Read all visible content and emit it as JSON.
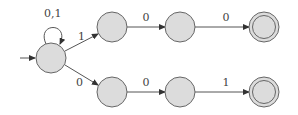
{
  "diagram": {
    "type": "nfa",
    "states": [
      {
        "id": "q0",
        "x": 51,
        "y": 58,
        "start": true,
        "accept": false
      },
      {
        "id": "q1",
        "x": 112,
        "y": 27,
        "accept": false
      },
      {
        "id": "q2",
        "x": 180,
        "y": 27,
        "accept": false
      },
      {
        "id": "q3",
        "x": 264,
        "y": 27,
        "accept": true
      },
      {
        "id": "q4",
        "x": 112,
        "y": 92,
        "accept": false
      },
      {
        "id": "q5",
        "x": 180,
        "y": 92,
        "accept": false
      },
      {
        "id": "q6",
        "x": 264,
        "y": 92,
        "accept": true
      }
    ],
    "labels": {
      "self_loop": "0,1",
      "q0_q1": "1",
      "q1_q2": "0",
      "q2_q3": "0",
      "q0_q4": "0",
      "q4_q5": "0",
      "q5_q6": "1"
    }
  }
}
